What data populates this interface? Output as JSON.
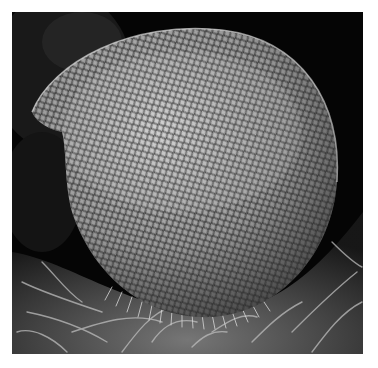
{
  "image": {
    "subject": "compound-eye-sem-micrograph",
    "description": "Scanning electron micrograph of an insect compound eye with hexagonal ommatidia facets, surrounded by hair-like setae",
    "colors": {
      "background": "#050505",
      "border": "#ffffff",
      "eye_light": "#c9c9c9",
      "eye_mid": "#8f8f8f",
      "eye_dark": "#3c3c3c",
      "tissue": "#6a6a6a"
    }
  }
}
